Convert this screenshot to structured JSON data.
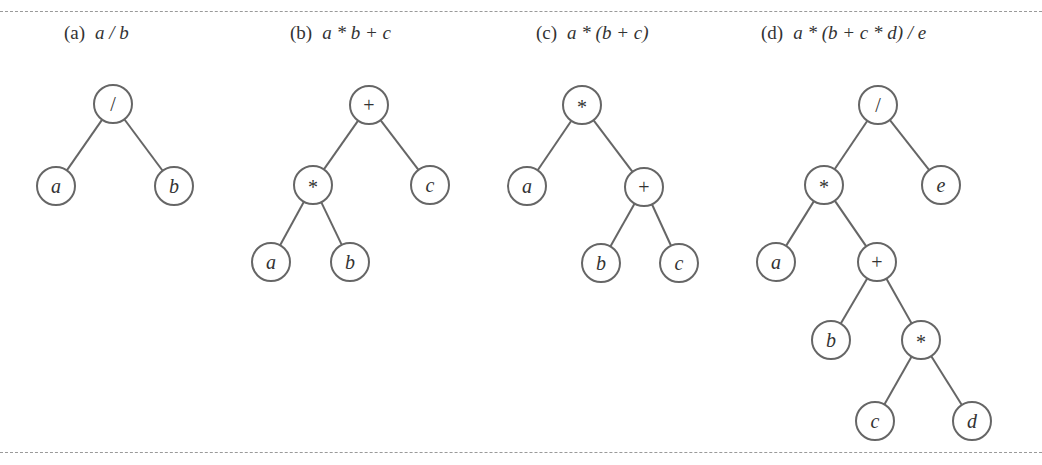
{
  "figure": {
    "panels": [
      {
        "id": "a",
        "label": "(a)",
        "expression": "a / b",
        "caption_x": 64,
        "nodes": [
          {
            "id": "a1",
            "text": "/",
            "kind": "op",
            "x": 113,
            "y": 104
          },
          {
            "id": "a2",
            "text": "a",
            "kind": "var",
            "x": 56,
            "y": 186
          },
          {
            "id": "a3",
            "text": "b",
            "kind": "var",
            "x": 174,
            "y": 186
          }
        ],
        "edges": [
          [
            "a1",
            "a2"
          ],
          [
            "a1",
            "a3"
          ]
        ]
      },
      {
        "id": "b",
        "label": "(b)",
        "expression": "a * b + c",
        "caption_x": 290,
        "nodes": [
          {
            "id": "b1",
            "text": "+",
            "kind": "op",
            "x": 369,
            "y": 105
          },
          {
            "id": "b2",
            "text": "*",
            "kind": "op",
            "x": 313,
            "y": 185
          },
          {
            "id": "b3",
            "text": "c",
            "kind": "var",
            "x": 430,
            "y": 185
          },
          {
            "id": "b4",
            "text": "a",
            "kind": "var",
            "x": 271,
            "y": 262
          },
          {
            "id": "b5",
            "text": "b",
            "kind": "var",
            "x": 350,
            "y": 262
          }
        ],
        "edges": [
          [
            "b1",
            "b2"
          ],
          [
            "b1",
            "b3"
          ],
          [
            "b2",
            "b4"
          ],
          [
            "b2",
            "b5"
          ]
        ]
      },
      {
        "id": "c",
        "label": "(c)",
        "expression": "a * (b + c)",
        "caption_x": 536,
        "nodes": [
          {
            "id": "c1",
            "text": "*",
            "kind": "op",
            "x": 582,
            "y": 105
          },
          {
            "id": "c2",
            "text": "a",
            "kind": "var",
            "x": 527,
            "y": 186
          },
          {
            "id": "c3",
            "text": "+",
            "kind": "op",
            "x": 644,
            "y": 187
          },
          {
            "id": "c4",
            "text": "b",
            "kind": "var",
            "x": 601,
            "y": 263
          },
          {
            "id": "c5",
            "text": "c",
            "kind": "var",
            "x": 679,
            "y": 263
          }
        ],
        "edges": [
          [
            "c1",
            "c2"
          ],
          [
            "c1",
            "c3"
          ],
          [
            "c3",
            "c4"
          ],
          [
            "c3",
            "c5"
          ]
        ]
      },
      {
        "id": "d",
        "label": "(d)",
        "expression": "a * (b + c * d) / e",
        "caption_x": 761,
        "nodes": [
          {
            "id": "d1",
            "text": "/",
            "kind": "op",
            "x": 878,
            "y": 105
          },
          {
            "id": "d2",
            "text": "*",
            "kind": "op",
            "x": 824,
            "y": 185
          },
          {
            "id": "d3",
            "text": "e",
            "kind": "var",
            "x": 941,
            "y": 185
          },
          {
            "id": "d4",
            "text": "a",
            "kind": "var",
            "x": 776,
            "y": 262
          },
          {
            "id": "d5",
            "text": "+",
            "kind": "op",
            "x": 877,
            "y": 262
          },
          {
            "id": "d6",
            "text": "b",
            "kind": "var",
            "x": 831,
            "y": 340
          },
          {
            "id": "d7",
            "text": "*",
            "kind": "op",
            "x": 921,
            "y": 340
          },
          {
            "id": "d8",
            "text": "c",
            "kind": "var",
            "x": 875,
            "y": 421
          },
          {
            "id": "d9",
            "text": "d",
            "kind": "var",
            "x": 972,
            "y": 421
          }
        ],
        "edges": [
          [
            "d1",
            "d2"
          ],
          [
            "d1",
            "d3"
          ],
          [
            "d2",
            "d4"
          ],
          [
            "d2",
            "d5"
          ],
          [
            "d5",
            "d6"
          ],
          [
            "d5",
            "d7"
          ],
          [
            "d7",
            "d8"
          ],
          [
            "d7",
            "d9"
          ]
        ]
      }
    ],
    "style": {
      "node_radius": 19,
      "stroke_color": "#666666",
      "text_color": "#333333"
    }
  }
}
